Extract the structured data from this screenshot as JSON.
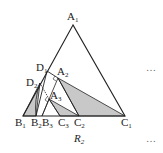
{
  "diagram": {
    "caption": {
      "base": "R",
      "sub": "2"
    },
    "ellipsis": [
      "…",
      "…"
    ],
    "labels": [
      {
        "id": "A1",
        "base": "A",
        "sub": "1",
        "x": 67,
        "y": 11
      },
      {
        "id": "D1",
        "base": "D",
        "sub": "1",
        "x": 36,
        "y": 62
      },
      {
        "id": "A2",
        "base": "A",
        "sub": "2",
        "x": 57,
        "y": 66
      },
      {
        "id": "D2",
        "base": "D",
        "sub": "2",
        "x": 26,
        "y": 77
      },
      {
        "id": "A3",
        "base": "A",
        "sub": "3",
        "x": 50,
        "y": 90
      },
      {
        "id": "B1",
        "base": "B",
        "sub": "1",
        "x": 15,
        "y": 117
      },
      {
        "id": "B2",
        "base": "B",
        "sub": "2",
        "x": 31,
        "y": 117
      },
      {
        "id": "B3",
        "base": "B",
        "sub": "3",
        "x": 42,
        "y": 117
      },
      {
        "id": "C3",
        "base": "C",
        "sub": "3",
        "x": 58,
        "y": 117
      },
      {
        "id": "C2",
        "base": "C",
        "sub": "2",
        "x": 74,
        "y": 117
      },
      {
        "id": "C1",
        "base": "C",
        "sub": "1",
        "x": 121,
        "y": 117
      }
    ],
    "colors": {
      "stroke": "#222222",
      "fill": "#c8c8c8"
    }
  }
}
